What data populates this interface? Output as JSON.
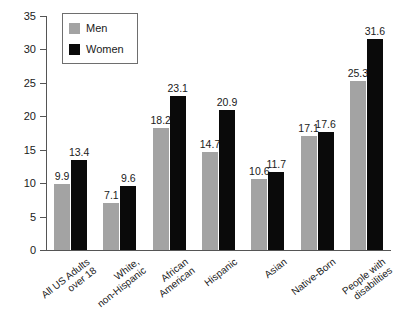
{
  "chart_data": {
    "type": "bar",
    "title": "",
    "subtitle": "",
    "xlabel": "",
    "ylabel": "",
    "ylim": [
      0,
      35
    ],
    "yticks": [
      0,
      5,
      10,
      15,
      20,
      25,
      30,
      35
    ],
    "grid": false,
    "legend_position": "top-left",
    "categories": [
      "All US Adults\nover 18",
      "White,\nnon-Hispanic",
      "African\nAmerican",
      "Hispanic",
      "Asian",
      "Native-Born",
      "People with\ndisabilities"
    ],
    "category_lines": [
      [
        "All US Adults",
        "over 18"
      ],
      [
        "White,",
        "non-Hispanic"
      ],
      [
        "African",
        "American"
      ],
      [
        "Hispanic"
      ],
      [
        "Asian"
      ],
      [
        "Native-Born"
      ],
      [
        "People with",
        "disabilities"
      ]
    ],
    "series": [
      {
        "name": "Men",
        "color": "#a3a3a3",
        "values": [
          9.9,
          7.1,
          18.2,
          14.7,
          10.6,
          17.1,
          25.3
        ]
      },
      {
        "name": "Women",
        "color": "#0a0a0a",
        "values": [
          13.4,
          9.6,
          23.1,
          20.9,
          11.7,
          17.6,
          31.6
        ]
      }
    ]
  },
  "legend": {
    "entries": [
      {
        "label": "Men",
        "swatch": "men"
      },
      {
        "label": "Women",
        "swatch": "women"
      }
    ]
  },
  "colors": {
    "men": "#a3a3a3",
    "women": "#0a0a0a",
    "axis": "#555555",
    "text": "#1a1a1a",
    "background": "#ffffff"
  }
}
